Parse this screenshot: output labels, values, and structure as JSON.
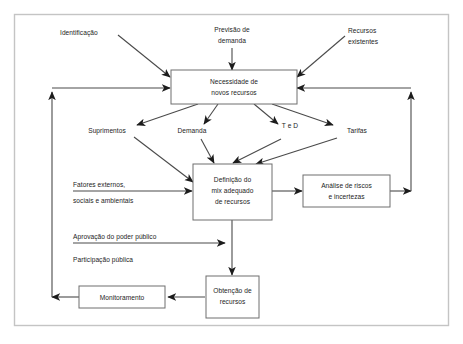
{
  "diagram": {
    "frame_color": "#c4c4c4",
    "line_color": "#4a4a4a",
    "box_stroke_color": "#6e6e6e",
    "background_color": "#ffffff"
  },
  "boxes": {
    "necessidade": {
      "line1": "Necessidade de",
      "line2": "novos recursos"
    },
    "definicao": {
      "line1": "Definição do",
      "line2": "mix adequado",
      "line3": "de recursos"
    },
    "analise": {
      "line1": "Análise de riscos",
      "line2": "e incertezas"
    },
    "obtencao": {
      "line1": "Obtenção de",
      "line2": "recursos"
    },
    "monitoramento": {
      "line1": "Monitoramento"
    }
  },
  "inputs_top": {
    "identificacao": "Identificação",
    "previsao_l1": "Previsão de",
    "previsao_l2": "demanda",
    "recursos_l1": "Recursos",
    "recursos_l2": "existentes"
  },
  "middle_nodes": {
    "suprimentos": "Suprimentos",
    "demanda": "Demanda",
    "ted": "T e D",
    "tarifas": "Tarifas"
  },
  "inputs_left": {
    "fatores_l1": "Fatores externos,",
    "fatores_l2": "sociais e ambientais",
    "aprovacao": "Aprovação do poder público",
    "participacao": "Participação pública"
  }
}
